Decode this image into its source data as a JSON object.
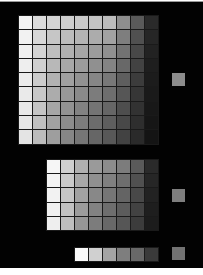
{
  "top_grid": {
    "cols": 10,
    "rows": 9,
    "left": 18,
    "top": 14,
    "cell_w": 13,
    "cell_h": 13.3,
    "rows_data": [
      [
        "#f4f4f4",
        "#dcdcdc",
        "#d4d4d4",
        "#cfcfcf",
        "#cacaca",
        "#c4c4c4",
        "#bdbdbd",
        "#8e8e8e",
        "#5a5a5a",
        "#2a2a2a"
      ],
      [
        "#f2f2f2",
        "#d8d8d8",
        "#c6c6c6",
        "#bcbcbc",
        "#b4b4b4",
        "#acacac",
        "#a2a2a2",
        "#7e7e7e",
        "#505050",
        "#262626"
      ],
      [
        "#f0f0f0",
        "#d4d4d4",
        "#bebebe",
        "#b0b0b0",
        "#a6a6a6",
        "#9c9c9c",
        "#909090",
        "#727272",
        "#484848",
        "#222222"
      ],
      [
        "#eeeeee",
        "#d0d0d0",
        "#b8b8b8",
        "#a8a8a8",
        "#9c9c9c",
        "#909090",
        "#848484",
        "#686868",
        "#424242",
        "#1e1e1e"
      ],
      [
        "#ececec",
        "#cccccc",
        "#b2b2b2",
        "#a0a0a0",
        "#929292",
        "#868686",
        "#787878",
        "#5e5e5e",
        "#3c3c3c",
        "#1c1c1c"
      ],
      [
        "#eaeaea",
        "#c8c8c8",
        "#acacac",
        "#989898",
        "#8a8a8a",
        "#7c7c7c",
        "#6e6e6e",
        "#565656",
        "#363636",
        "#1a1a1a"
      ],
      [
        "#e8e8e8",
        "#c4c4c4",
        "#a6a6a6",
        "#929292",
        "#828282",
        "#747474",
        "#666666",
        "#4e4e4e",
        "#323232",
        "#181818"
      ],
      [
        "#e6e6e6",
        "#c0c0c0",
        "#a2a2a2",
        "#8c8c8c",
        "#7c7c7c",
        "#6c6c6c",
        "#5e5e5e",
        "#484848",
        "#2e2e2e",
        "#161616"
      ],
      [
        "#e4e4e4",
        "#bcbcbc",
        "#9e9e9e",
        "#868686",
        "#767676",
        "#666666",
        "#585858",
        "#424242",
        "#2a2a2a",
        "#141414"
      ]
    ]
  },
  "middle_grid": {
    "cols": 8,
    "rows": 5,
    "left": 46,
    "top": 158,
    "cell_w": 13,
    "cell_h": 13.2,
    "rows_data": [
      [
        "#f6f6f6",
        "#cfcfcf",
        "#b0b0b0",
        "#9a9a9a",
        "#8c8c8c",
        "#7c7c7c",
        "#5a5a5a",
        "#2a2a2a"
      ],
      [
        "#f4f4f4",
        "#cacaca",
        "#a8a8a8",
        "#909090",
        "#808080",
        "#6e6e6e",
        "#505050",
        "#262626"
      ],
      [
        "#f2f2f2",
        "#c6c6c6",
        "#a2a2a2",
        "#888888",
        "#767676",
        "#646464",
        "#484848",
        "#222222"
      ],
      [
        "#f0f0f0",
        "#c2c2c2",
        "#9c9c9c",
        "#828282",
        "#6e6e6e",
        "#5c5c5c",
        "#424242",
        "#1e1e1e"
      ],
      [
        "#eeeeee",
        "#bebebe",
        "#969696",
        "#7c7c7c",
        "#686868",
        "#565656",
        "#3c3c3c",
        "#1c1c1c"
      ]
    ]
  },
  "bottom_strip": {
    "cols": 6,
    "rows": 1,
    "left": 74,
    "top": 246,
    "cell_w": 13,
    "cell_h": 13,
    "rows_data": [
      [
        "#fafafa",
        "#d0d0d0",
        "#a4a4a4",
        "#7e7e7e",
        "#686868",
        "#3a3a3a"
      ]
    ]
  },
  "side_swatches": [
    {
      "left": 172,
      "top": 72,
      "color": "#8c8c8c"
    },
    {
      "left": 172,
      "top": 188,
      "color": "#7e7e7e"
    },
    {
      "left": 172,
      "top": 246,
      "color": "#727272"
    }
  ],
  "colors": {
    "background": "#020202",
    "grid_line": "#1a1a1a",
    "page": "#ffffff"
  }
}
